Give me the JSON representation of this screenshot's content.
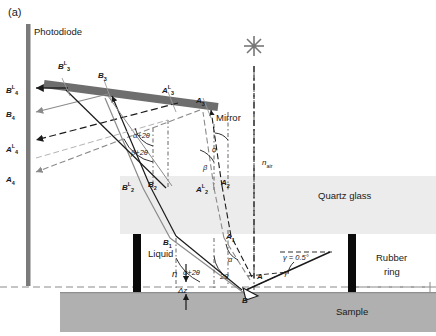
{
  "figure": {
    "panel_label": "(a)",
    "colors": {
      "photodiode": "#7a7a7a",
      "mirror": "#6e6e6e",
      "quartz_glass": "#ececec",
      "sample": "#b0b0b0",
      "rubber_ring": "#0a0a0a",
      "ray_dark": "#1a1a1a",
      "ray_gray": "#8a8a8a",
      "axis_dashdot": "#555555",
      "liquid_level_dash": "#8a8a8a",
      "background": "#ffffff",
      "star": "#777777"
    }
  },
  "components": {
    "photodiode": "Photodiode",
    "mirror": "Mirror",
    "quartz_glass": "Quartz glass",
    "liquid": "Liquid",
    "rubber_ring_line1": "Rubber",
    "rubber_ring_line2": "ring",
    "sample": "Sample"
  },
  "media": {
    "n_air_symbol": "n",
    "n_air_subscript": "air",
    "n_liquid_symbol": "n"
  },
  "detector_labels": [
    {
      "name": "B4L",
      "base": "B",
      "sub": "4",
      "sup": "L",
      "x": 6,
      "y": 84
    },
    {
      "name": "B4",
      "base": "B",
      "sub": "4",
      "sup": "",
      "x": 6,
      "y": 110
    },
    {
      "name": "A4L",
      "base": "A",
      "sub": "4",
      "sup": "L",
      "x": 6,
      "y": 143
    },
    {
      "name": "A4",
      "base": "A",
      "sub": "4",
      "sup": "",
      "x": 6,
      "y": 175
    }
  ],
  "mirror_labels": [
    {
      "name": "B3L",
      "base": "B",
      "sub": "3",
      "sup": "L",
      "x": 58,
      "y": 60
    },
    {
      "name": "B3",
      "base": "B",
      "sub": "3",
      "sup": "",
      "x": 98,
      "y": 71
    },
    {
      "name": "A3L",
      "base": "A",
      "sub": "3",
      "sup": "L",
      "x": 162,
      "y": 84
    },
    {
      "name": "A3",
      "base": "A",
      "sub": "3",
      "sup": "",
      "x": 196,
      "y": 96
    }
  ],
  "surface_labels": [
    {
      "name": "B2L",
      "base": "B",
      "sub": "2",
      "sup": "L",
      "x": 122,
      "y": 181
    },
    {
      "name": "B2",
      "base": "B",
      "sub": "2",
      "sup": "",
      "x": 148,
      "y": 180
    },
    {
      "name": "A2L",
      "base": "A",
      "sub": "2",
      "sup": "L",
      "x": 196,
      "y": 183
    },
    {
      "name": "A2",
      "base": "A",
      "sub": "2",
      "sup": "",
      "x": 221,
      "y": 178
    }
  ],
  "interface_labels": [
    {
      "name": "B1",
      "base": "B",
      "sub": "1",
      "sup": "",
      "x": 163,
      "y": 238
    },
    {
      "name": "A1",
      "base": "A",
      "sub": "1",
      "sup": "",
      "x": 226,
      "y": 232
    },
    {
      "name": "A",
      "base": "A",
      "sub": "",
      "sup": "",
      "x": 257,
      "y": 272
    },
    {
      "name": "B",
      "base": "B",
      "sub": "",
      "sup": "",
      "x": 242,
      "y": 296
    }
  ],
  "angles": [
    {
      "name": "alpha-plus-2theta-upper",
      "text": "α+2θ",
      "x": 133,
      "y": 131
    },
    {
      "name": "beta-plus-2theta-upper",
      "text": "β+2θ",
      "x": 131,
      "y": 148
    },
    {
      "name": "alpha-right",
      "text": "α",
      "x": 212,
      "y": 145
    },
    {
      "name": "beta-right",
      "text": "β",
      "x": 203,
      "y": 163
    },
    {
      "name": "alpha-plus-2theta-lower",
      "text": "α+2θ",
      "x": 183,
      "y": 268
    },
    {
      "name": "alpha-lower",
      "text": "α",
      "x": 228,
      "y": 255
    },
    {
      "name": "two-theta-lower",
      "text": "2θ",
      "x": 220,
      "y": 272
    },
    {
      "name": "gamma-value",
      "text": "γ = 0.5°",
      "x": 283,
      "y": 253
    },
    {
      "name": "gamma-vertex",
      "text": "γ",
      "x": 284,
      "y": 268
    }
  ],
  "measurements": {
    "delta_z": "Δz"
  }
}
